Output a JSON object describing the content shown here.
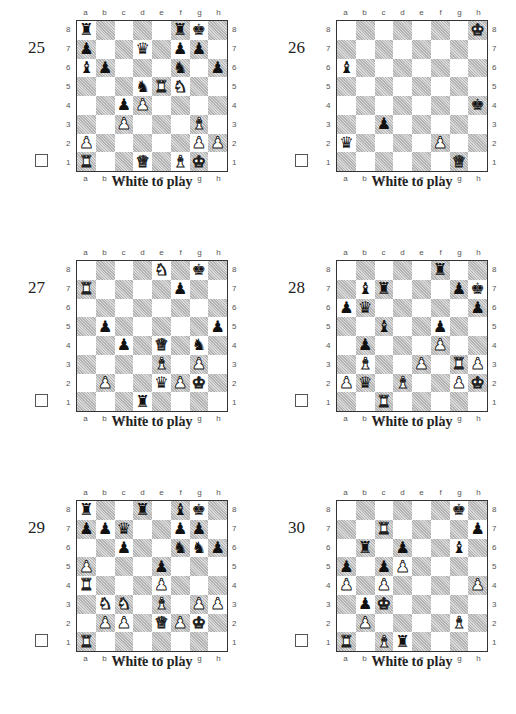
{
  "files": [
    "a",
    "b",
    "c",
    "d",
    "e",
    "f",
    "g",
    "h"
  ],
  "ranks": [
    "8",
    "7",
    "6",
    "5",
    "4",
    "3",
    "2",
    "1"
  ],
  "piece_glyphs": {
    "K": "♚",
    "Q": "♛",
    "R": "♜",
    "B": "♝",
    "N": "♞",
    "P": "♟"
  },
  "puzzles": [
    {
      "number": "25",
      "caption": "White to play",
      "fen_rows": [
        "r4rk1",
        "p2q1pp1",
        "bp3n1p",
        "3nRN2",
        "2pP4",
        "2P3B1",
        "P5PP",
        "R2Q1BK1"
      ]
    },
    {
      "number": "26",
      "caption": "White to play",
      "fen_rows": [
        "7K",
        "8",
        "b7",
        "8",
        "7k",
        "2p5",
        "q4P2",
        "6Q1"
      ]
    },
    {
      "number": "27",
      "caption": "White to play",
      "fen_rows": [
        "4N1k1",
        "R4p2",
        "8",
        "1p5p",
        "2p1Q1n1",
        "4B1P1",
        "1P2qPK1",
        "3r4"
      ]
    },
    {
      "number": "28",
      "caption": "White to play",
      "fen_rows": [
        "5r2",
        "1br3pk",
        "pq5p",
        "2b2p2",
        "1p3P2",
        "1B2P1RP",
        "Pq1B2PK",
        "2R5"
      ]
    },
    {
      "number": "29",
      "caption": "White to play",
      "fen_rows": [
        "r2r1bk1",
        "ppq2pp1",
        "2p2nnp",
        "P3p3",
        "R3P3",
        "1NN1B1PP",
        "1PP1QPK1",
        "R7"
      ]
    },
    {
      "number": "30",
      "caption": "White to play",
      "fen_rows": [
        "6k1",
        "2R4p",
        "1r1p2b1",
        "p1pP4",
        "P1P4P",
        "1pK5",
        "1P4B1",
        "R1Br4"
      ]
    }
  ]
}
